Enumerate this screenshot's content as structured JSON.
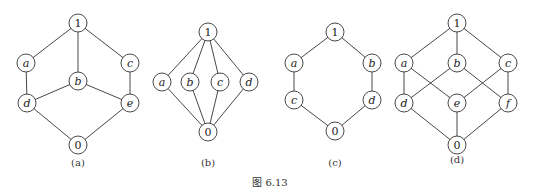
{
  "caption": "图  6.13",
  "diagrams": [
    {
      "id": "a",
      "label": "(a)",
      "label_pos": [
        78,
        166
      ],
      "nodes": [
        {
          "id": "1",
          "label": "1",
          "x": 78,
          "y": 23
        },
        {
          "id": "a",
          "label": "a",
          "x": 26,
          "y": 63
        },
        {
          "id": "b",
          "label": "b",
          "x": 78,
          "y": 81
        },
        {
          "id": "c",
          "label": "c",
          "x": 130,
          "y": 63
        },
        {
          "id": "d",
          "label": "d",
          "x": 27,
          "y": 103
        },
        {
          "id": "e",
          "label": "e",
          "x": 130,
          "y": 103
        },
        {
          "id": "0",
          "label": "0",
          "x": 78,
          "y": 145
        }
      ],
      "edges": [
        [
          "1",
          "a"
        ],
        [
          "1",
          "b"
        ],
        [
          "1",
          "c"
        ],
        [
          "a",
          "d"
        ],
        [
          "c",
          "e"
        ],
        [
          "b",
          "d"
        ],
        [
          "b",
          "e"
        ],
        [
          "d",
          "0"
        ],
        [
          "e",
          "0"
        ]
      ]
    },
    {
      "id": "b",
      "label": "(b)",
      "label_pos": [
        208,
        166
      ],
      "nodes": [
        {
          "id": "1",
          "label": "1",
          "x": 208,
          "y": 32
        },
        {
          "id": "a",
          "label": "a",
          "x": 162,
          "y": 82
        },
        {
          "id": "b",
          "label": "b",
          "x": 190,
          "y": 82
        },
        {
          "id": "c",
          "label": "c",
          "x": 220,
          "y": 82
        },
        {
          "id": "d",
          "label": "d",
          "x": 249,
          "y": 82
        },
        {
          "id": "0",
          "label": "0",
          "x": 208,
          "y": 132
        }
      ],
      "edges": [
        [
          "1",
          "a"
        ],
        [
          "1",
          "b"
        ],
        [
          "1",
          "c"
        ],
        [
          "1",
          "d"
        ],
        [
          "a",
          "0"
        ],
        [
          "b",
          "0"
        ],
        [
          "c",
          "0"
        ],
        [
          "d",
          "0"
        ]
      ]
    },
    {
      "id": "c",
      "label": "(c)",
      "label_pos": [
        335,
        166
      ],
      "nodes": [
        {
          "id": "1",
          "label": "1",
          "x": 335,
          "y": 32
        },
        {
          "id": "a",
          "label": "a",
          "x": 294,
          "y": 63
        },
        {
          "id": "b",
          "label": "b",
          "x": 372,
          "y": 63
        },
        {
          "id": "c",
          "label": "c",
          "x": 294,
          "y": 100
        },
        {
          "id": "d",
          "label": "d",
          "x": 372,
          "y": 100
        },
        {
          "id": "0",
          "label": "0",
          "x": 335,
          "y": 131
        }
      ],
      "edges": [
        [
          "1",
          "a"
        ],
        [
          "1",
          "b"
        ],
        [
          "a",
          "c"
        ],
        [
          "b",
          "d"
        ],
        [
          "c",
          "0"
        ],
        [
          "d",
          "0"
        ]
      ]
    },
    {
      "id": "d",
      "label": "(d)",
      "label_pos": [
        457,
        163
      ],
      "nodes": [
        {
          "id": "1",
          "label": "1",
          "x": 457,
          "y": 23
        },
        {
          "id": "a",
          "label": "a",
          "x": 404,
          "y": 63
        },
        {
          "id": "b",
          "label": "b",
          "x": 457,
          "y": 63
        },
        {
          "id": "c",
          "label": "c",
          "x": 508,
          "y": 63
        },
        {
          "id": "d",
          "label": "d",
          "x": 404,
          "y": 103
        },
        {
          "id": "e",
          "label": "e",
          "x": 457,
          "y": 103
        },
        {
          "id": "f",
          "label": "f",
          "x": 508,
          "y": 103
        },
        {
          "id": "0",
          "label": "0",
          "x": 457,
          "y": 145
        }
      ],
      "edges": [
        [
          "1",
          "a"
        ],
        [
          "1",
          "b"
        ],
        [
          "1",
          "c"
        ],
        [
          "a",
          "d"
        ],
        [
          "a",
          "e"
        ],
        [
          "b",
          "d"
        ],
        [
          "b",
          "f"
        ],
        [
          "c",
          "e"
        ],
        [
          "c",
          "f"
        ],
        [
          "d",
          "0"
        ],
        [
          "e",
          "0"
        ],
        [
          "f",
          "0"
        ]
      ]
    }
  ]
}
